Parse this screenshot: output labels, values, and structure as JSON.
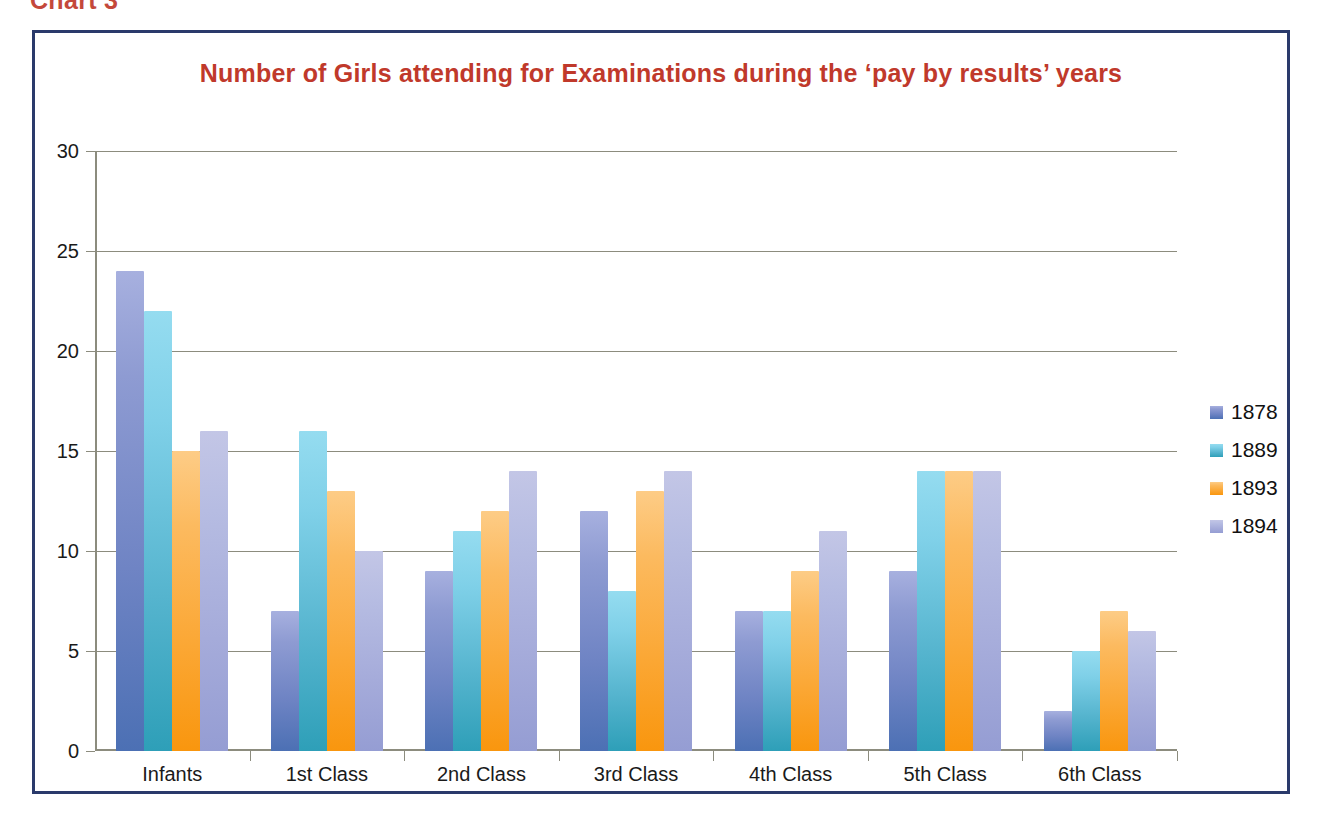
{
  "caption": "Chart 3",
  "chart_data": {
    "type": "bar",
    "title": "Number of Girls attending for Examinations during the ‘pay by results’ years",
    "xlabel": "",
    "ylabel": "",
    "ylim": [
      0,
      30
    ],
    "yticks": [
      0,
      5,
      10,
      15,
      20,
      25,
      30
    ],
    "ytick_labels": [
      "0",
      "5",
      "10",
      "15",
      "20",
      "25",
      "30"
    ],
    "grid": true,
    "legend_position": "right",
    "categories": [
      "Infants",
      "1st Class",
      "2nd Class",
      "3rd Class",
      "4th Class",
      "5th Class",
      "6th Class"
    ],
    "series": [
      {
        "name": "1878",
        "color": "#5B78BE",
        "values": [
          24,
          7,
          9,
          12,
          7,
          9,
          2
        ]
      },
      {
        "name": "1889",
        "color": "#5FC0D8",
        "values": [
          22,
          16,
          11,
          8,
          7,
          14,
          5
        ]
      },
      {
        "name": "1893",
        "color": "#F9A01B",
        "values": [
          15,
          13,
          12,
          13,
          9,
          14,
          7
        ]
      },
      {
        "name": "1894",
        "color": "#AEB5DE",
        "values": [
          16,
          10,
          14,
          14,
          11,
          14,
          6
        ]
      }
    ]
  },
  "colors": {
    "title": "#C0392B",
    "frame_border": "#2A3A6B",
    "axis": "#8C8C7E",
    "background": "#FFFFFF"
  }
}
